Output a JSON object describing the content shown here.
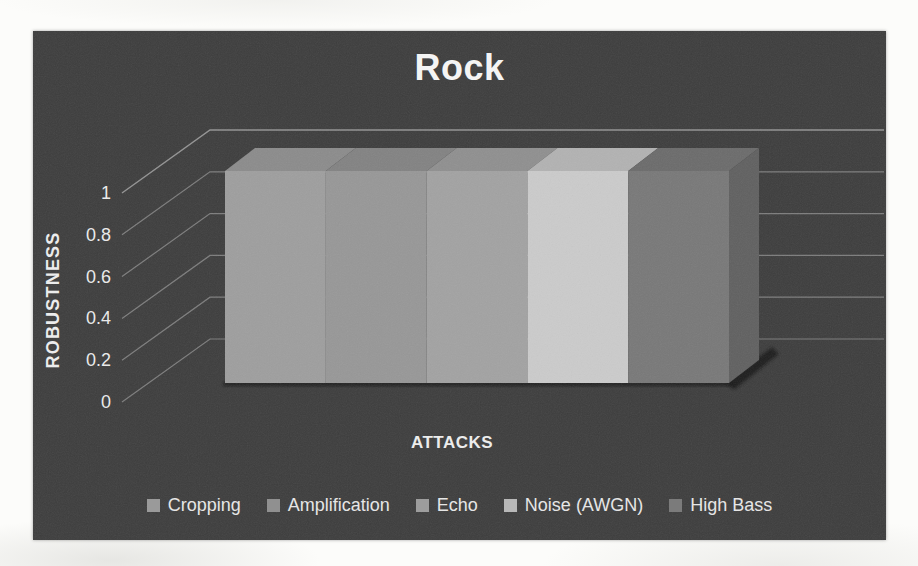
{
  "chart_data": {
    "type": "bar",
    "style": "3d-column",
    "title": "Rock",
    "xlabel": "ATTACKS",
    "ylabel": "ROBUSTNESS",
    "categories": [
      "Cropping",
      "Amplification",
      "Echo",
      "Noise (AWGN)",
      "High Bass"
    ],
    "values": [
      1,
      1,
      1,
      1,
      1
    ],
    "ylim": [
      0,
      1
    ],
    "yticks": [
      0,
      0.2,
      0.4,
      0.6,
      0.8,
      1
    ],
    "ytick_labels": [
      "0",
      "0.2",
      "0.4",
      "0.6",
      "0.8",
      "1"
    ],
    "grid": true,
    "legend_position": "bottom",
    "bar_colors": [
      {
        "front": "#9e9e9e",
        "top": "#8b8b8b"
      },
      {
        "front": "#979797",
        "top": "#828282"
      },
      {
        "front": "#a2a2a2",
        "top": "#8f8f8f"
      },
      {
        "front": "#cbcbcb",
        "top": "#b2b2b2"
      },
      {
        "front": "#787878",
        "top": "#6b6b6b",
        "side": "#606060"
      }
    ],
    "legend_swatch_colors": [
      "#9a9a9a",
      "#909090",
      "#9d9d9d",
      "#b8b8b8",
      "#7b7b7b"
    ],
    "colors": {
      "chart_background": "#3d3d3d",
      "page_background": "#fcfcfa",
      "text": "#ececec",
      "gridline": "#989898",
      "shadow": "#181818"
    }
  }
}
